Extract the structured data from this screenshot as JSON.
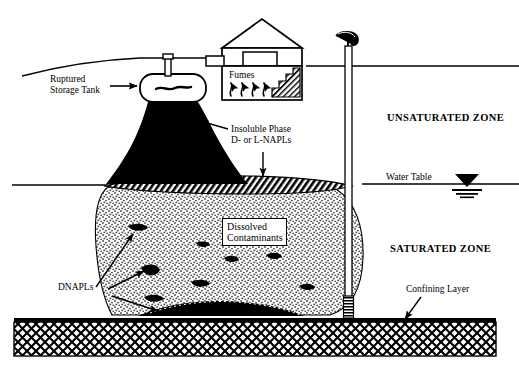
{
  "diagram": {
    "labels": {
      "ruptured_tank": "Ruptured\nStorage Tank",
      "fumes": "Fumes",
      "insoluble_phase": "Insoluble Phase\nD- or L-NAPLs",
      "unsaturated_zone": "UNSATURATED ZONE",
      "water_table": "Water Table",
      "saturated_zone": "SATURATED ZONE",
      "dissolved_contaminants": "Dissolved\nContaminants",
      "dnapls": "DNAPLs",
      "confining_layer": "Confining Layer"
    },
    "colors": {
      "ink": "#000000",
      "paper": "#ffffff",
      "napl_fill": "#000000",
      "plume_stipple": "#9a9a9a",
      "confining_hatch": "#000000"
    },
    "features": [
      {
        "name": "ground-surface",
        "kind": "line"
      },
      {
        "name": "house",
        "kind": "structure"
      },
      {
        "name": "basement",
        "kind": "structure"
      },
      {
        "name": "stairs",
        "kind": "structure"
      },
      {
        "name": "fume-arrows",
        "kind": "arrows",
        "count": 4
      },
      {
        "name": "storage-tank",
        "kind": "vessel"
      },
      {
        "name": "tank-vent-pipe",
        "kind": "pipe"
      },
      {
        "name": "napl-plume",
        "kind": "mass"
      },
      {
        "name": "lnapl-lens",
        "kind": "layer"
      },
      {
        "name": "water-well",
        "kind": "well"
      },
      {
        "name": "well-screen",
        "kind": "screen"
      },
      {
        "name": "dissolved-plume",
        "kind": "plume"
      },
      {
        "name": "dnapl-blobs",
        "kind": "blobs",
        "count": 9
      },
      {
        "name": "water-table-symbol",
        "kind": "symbol"
      },
      {
        "name": "confining-layer",
        "kind": "layer"
      }
    ]
  }
}
